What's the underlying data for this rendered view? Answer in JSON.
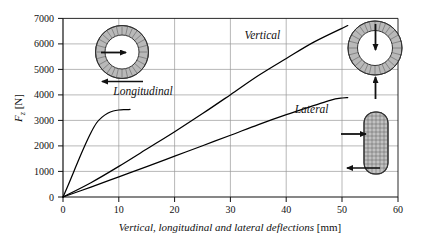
{
  "chart_data": {
    "type": "line",
    "title": "",
    "xlabel": "Vertical, longitudinal and lateral deflections [mm]",
    "ylabel": "F_z [N]",
    "ylabel_base": "F",
    "ylabel_sub": "z",
    "ylabel_unit": "[N]",
    "xlabel_text": "Vertical, longitudinal and lateral deflections",
    "xlabel_unit": "[mm]",
    "xlim": [
      0,
      60
    ],
    "ylim": [
      0,
      7000
    ],
    "xticks": [
      "0",
      "10",
      "20",
      "30",
      "40",
      "50",
      "60"
    ],
    "xtick_values": [
      0,
      10,
      20,
      30,
      40,
      50,
      60
    ],
    "yticks": [
      "0",
      "1000",
      "2000",
      "3000",
      "4000",
      "5000",
      "6000",
      "7000"
    ],
    "ytick_values": [
      0,
      1000,
      2000,
      3000,
      4000,
      5000,
      6000,
      7000
    ],
    "grid": true,
    "legend_position": "inline-annotations",
    "line_color": "#000000",
    "grid_color": "#9a9a9a",
    "axis_color": "#000000",
    "series": [
      {
        "name": "Longitudinal",
        "label": "Longitudinal",
        "label_x": 9.0,
        "label_y": 4000,
        "points": [
          [
            0,
            0
          ],
          [
            1,
            500
          ],
          [
            2,
            1030
          ],
          [
            3,
            1560
          ],
          [
            4,
            2060
          ],
          [
            5,
            2520
          ],
          [
            6,
            2900
          ],
          [
            7,
            3130
          ],
          [
            8,
            3280
          ],
          [
            9,
            3370
          ],
          [
            10,
            3410
          ],
          [
            11,
            3425
          ],
          [
            12,
            3430
          ]
        ]
      },
      {
        "name": "Vertical",
        "label": "Vertical",
        "label_x": 32.5,
        "label_y": 6180,
        "points": [
          [
            0,
            0
          ],
          [
            5,
            560
          ],
          [
            10,
            1200
          ],
          [
            15,
            1880
          ],
          [
            20,
            2560
          ],
          [
            25,
            3270
          ],
          [
            30,
            4010
          ],
          [
            35,
            4760
          ],
          [
            40,
            5430
          ],
          [
            45,
            6080
          ],
          [
            51,
            6720
          ]
        ]
      },
      {
        "name": "Lateral",
        "label": "Lateral",
        "label_x": 41.5,
        "label_y": 3290,
        "points": [
          [
            0,
            0
          ],
          [
            5,
            390
          ],
          [
            10,
            790
          ],
          [
            15,
            1190
          ],
          [
            20,
            1600
          ],
          [
            25,
            2010
          ],
          [
            30,
            2420
          ],
          [
            35,
            2840
          ],
          [
            40,
            3230
          ],
          [
            45,
            3590
          ],
          [
            48,
            3800
          ],
          [
            50,
            3880
          ],
          [
            51,
            3895
          ]
        ]
      }
    ],
    "annotations": [
      {
        "name": "tire-longitudinal-diagram",
        "kind": "tire-radial",
        "arrows": [
          "right-from-center",
          "left-at-bottom"
        ]
      },
      {
        "name": "tire-vertical-diagram",
        "kind": "tire-radial",
        "arrows": [
          "down-from-top",
          "up-at-bottom"
        ]
      },
      {
        "name": "tire-lateral-diagram",
        "kind": "tire-front",
        "arrows": [
          "right-into-side",
          "left-at-bottom"
        ]
      }
    ]
  }
}
